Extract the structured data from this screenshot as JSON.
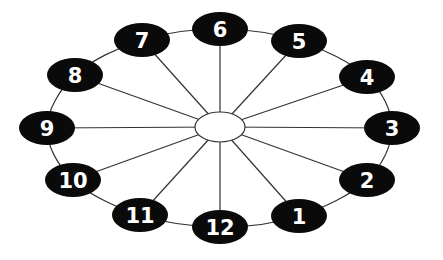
{
  "diagram": {
    "title": "",
    "hub": {
      "label": "",
      "cx": 220,
      "cy": 127,
      "rx": 25,
      "ry": 15
    },
    "colors": {
      "node_fill": "#0a0a0a",
      "node_text": "#ffffff",
      "line": "#333333",
      "hub_fill": "#ffffff",
      "background": "#ffffff"
    },
    "node_size": {
      "rx": 28,
      "ry": 17
    },
    "nodes": [
      {
        "label": "1",
        "cx": 299,
        "cy": 216
      },
      {
        "label": "2",
        "cx": 367,
        "cy": 180
      },
      {
        "label": "3",
        "cx": 392,
        "cy": 128
      },
      {
        "label": "4",
        "cx": 367,
        "cy": 77
      },
      {
        "label": "5",
        "cx": 299,
        "cy": 41
      },
      {
        "label": "6",
        "cx": 220,
        "cy": 29
      },
      {
        "label": "7",
        "cx": 142,
        "cy": 40
      },
      {
        "label": "8",
        "cx": 75,
        "cy": 75
      },
      {
        "label": "9",
        "cx": 47,
        "cy": 128
      },
      {
        "label": "10",
        "cx": 73,
        "cy": 180
      },
      {
        "label": "11",
        "cx": 140,
        "cy": 215
      },
      {
        "label": "12",
        "cx": 220,
        "cy": 227
      }
    ]
  }
}
